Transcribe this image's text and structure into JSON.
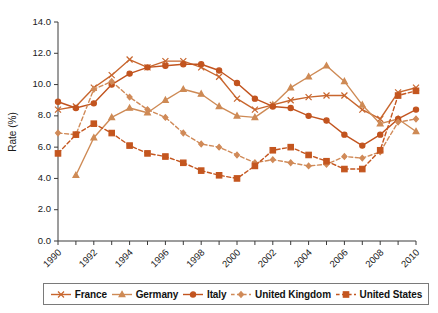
{
  "chart_data": {
    "type": "line",
    "title": "",
    "xlabel": "",
    "ylabel": "Rate (%)",
    "grid": false,
    "legend_position": "bottom",
    "ylim": [
      0.0,
      14.0
    ],
    "ytick_labels": [
      "0.0",
      "2.0",
      "4.0",
      "6.0",
      "8.0",
      "10.0",
      "12.0",
      "14.0"
    ],
    "ytick_values": [
      0,
      2,
      4,
      6,
      8,
      10,
      12,
      14
    ],
    "xlim": [
      1990,
      2010
    ],
    "x": [
      1990,
      1991,
      1992,
      1993,
      1994,
      1995,
      1996,
      1997,
      1998,
      1999,
      2000,
      2001,
      2002,
      2003,
      2004,
      2005,
      2006,
      2007,
      2008,
      2009,
      2010
    ],
    "xtick_labels": [
      "1990",
      "1992",
      "1994",
      "1996",
      "1998",
      "2000",
      "2002",
      "2004",
      "2006",
      "2008",
      "2010"
    ],
    "xtick_values": [
      1990,
      1992,
      1994,
      1996,
      1998,
      2000,
      2002,
      2004,
      2006,
      2008,
      2010
    ],
    "series": [
      {
        "name": "France",
        "marker": "x",
        "dash": false,
        "color": "#C8662E",
        "values": [
          8.4,
          8.6,
          9.8,
          10.6,
          11.6,
          11.1,
          11.5,
          11.5,
          11.1,
          10.5,
          9.1,
          8.4,
          8.7,
          9.0,
          9.2,
          9.3,
          9.3,
          8.4,
          7.8,
          9.5,
          9.8
        ]
      },
      {
        "name": "Germany",
        "marker": "triangle",
        "dash": false,
        "color": "#CE8A55",
        "values": [
          null,
          4.2,
          6.6,
          7.9,
          8.5,
          8.2,
          9.0,
          9.7,
          9.4,
          8.6,
          8.0,
          7.9,
          8.7,
          9.8,
          10.5,
          11.2,
          10.2,
          8.7,
          7.5,
          7.8,
          7.0
        ]
      },
      {
        "name": "Italy",
        "marker": "circle",
        "dash": false,
        "color": "#C2541F",
        "values": [
          8.9,
          8.5,
          8.8,
          10.0,
          10.7,
          11.1,
          11.2,
          11.3,
          11.3,
          10.9,
          10.1,
          9.1,
          8.6,
          8.5,
          8.0,
          7.7,
          6.8,
          6.1,
          6.8,
          7.8,
          8.4
        ]
      },
      {
        "name": "United Kingdom",
        "marker": "diamond",
        "dash": true,
        "color": "#D08A58",
        "values": [
          6.9,
          6.8,
          9.7,
          10.2,
          9.2,
          8.4,
          7.9,
          6.9,
          6.2,
          6.0,
          5.5,
          5.0,
          5.2,
          5.0,
          4.8,
          4.9,
          5.4,
          5.3,
          5.7,
          7.6,
          7.8
        ]
      },
      {
        "name": "United States",
        "marker": "square",
        "dash": true,
        "color": "#C4561F",
        "values": [
          5.6,
          6.8,
          7.5,
          6.9,
          6.1,
          5.6,
          5.4,
          5.0,
          4.5,
          4.2,
          4.0,
          4.8,
          5.8,
          6.0,
          5.5,
          5.1,
          4.6,
          4.6,
          5.8,
          9.3,
          9.6
        ]
      }
    ]
  },
  "legend": {
    "items": [
      {
        "label": "France",
        "marker": "x-marker",
        "dash": false,
        "color": "#C8662E"
      },
      {
        "label": "Germany",
        "marker": "triangle-marker",
        "dash": false,
        "color": "#CE8A55"
      },
      {
        "label": "Italy",
        "marker": "circle-marker",
        "dash": false,
        "color": "#C2541F"
      },
      {
        "label": "United Kingdom",
        "marker": "diamond-marker",
        "dash": true,
        "color": "#D08A58"
      },
      {
        "label": "United States",
        "marker": "square-marker",
        "dash": true,
        "color": "#C4561F"
      }
    ]
  },
  "colors": {
    "accent": "#C8662E",
    "axis": "#3a3a3a",
    "text": "#111111",
    "legend_border": "#7a7a7a",
    "background": "#ffffff"
  }
}
